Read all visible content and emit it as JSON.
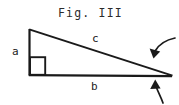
{
  "figure": {
    "title": "Fig. III",
    "background_color": "#ffffff",
    "ink_color": "#1a1a1a",
    "labels": {
      "vertical_leg": "a",
      "horizontal_leg": "b",
      "hypotenuse": "c"
    },
    "geometry": {
      "apex_top": [
        29,
        29
      ],
      "vertex_right_angle": [
        29,
        75
      ],
      "vertex_acute": [
        172,
        76
      ],
      "right_angle_marker": [
        29,
        57,
        16,
        18
      ]
    },
    "annotations": [
      {
        "name": "upper-arrow",
        "target": "hypotenuse-near-acute-vertex"
      },
      {
        "name": "lower-arrow",
        "target": "baseline-near-acute-vertex"
      }
    ]
  }
}
